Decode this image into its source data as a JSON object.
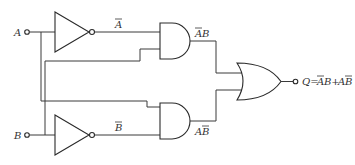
{
  "diagram": {
    "type": "logic-circuit",
    "inputs": [
      {
        "name": "A",
        "label": "A"
      },
      {
        "name": "B",
        "label": "B"
      }
    ],
    "gates": [
      {
        "id": "not_a",
        "type": "NOT",
        "input": "A",
        "output_label": "A",
        "output_overline": true
      },
      {
        "id": "not_b",
        "type": "NOT",
        "input": "B",
        "output_label": "B",
        "output_overline": true
      },
      {
        "id": "and_top",
        "type": "AND",
        "inputs": [
          "NOT A",
          "B"
        ],
        "output_label": "AB",
        "overlined_part": "A"
      },
      {
        "id": "and_bottom",
        "type": "AND",
        "inputs": [
          "A",
          "NOT B"
        ],
        "output_label": "AB",
        "overlined_part": "B"
      },
      {
        "id": "or_out",
        "type": "OR",
        "inputs": [
          "and_top",
          "and_bottom"
        ]
      }
    ],
    "labels": {
      "input_a": "A",
      "input_b": "B",
      "not_a_out": "A",
      "not_b_out": "B",
      "and_top_out_a": "A",
      "and_top_out_b": "B",
      "and_bottom_out_a": "A",
      "and_bottom_out_b": "B",
      "output_q": "Q=",
      "output_term1_a": "A",
      "output_term1_b": "B+",
      "output_term2_a": "A",
      "output_term2_b": "B"
    },
    "output": {
      "name": "Q",
      "expression": "Q=ĀB+AƁ"
    }
  }
}
